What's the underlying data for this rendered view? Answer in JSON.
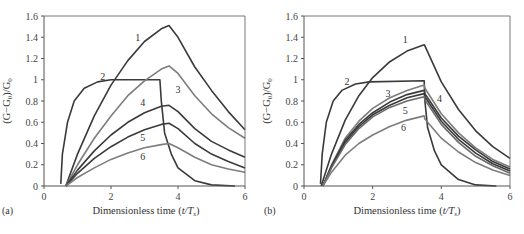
{
  "chart_data": [
    {
      "panel": "(a)",
      "type": "line",
      "title": "",
      "xlabel": "Dimensionless time (t/T_s)",
      "ylabel": "(G−G0)/G0",
      "xlim": [
        0,
        6
      ],
      "ylim": [
        0,
        1.6
      ],
      "xticks": [
        "0",
        "2",
        "4",
        "6"
      ],
      "yticks": [
        "0",
        "0.2",
        "0.4",
        "0.6",
        "0.8",
        "1",
        "1.2",
        "1.4",
        "1.6"
      ],
      "grid": false,
      "series": [
        {
          "name": "1",
          "label_pos": [
            2.8,
            1.39
          ],
          "points": [
            [
              0.65,
              0
            ],
            [
              1.0,
              0.3
            ],
            [
              1.5,
              0.66
            ],
            [
              2.0,
              0.95
            ],
            [
              2.5,
              1.18
            ],
            [
              3.0,
              1.36
            ],
            [
              3.5,
              1.48
            ],
            [
              3.73,
              1.51
            ],
            [
              4.0,
              1.4
            ],
            [
              4.5,
              1.12
            ],
            [
              5.0,
              0.9
            ],
            [
              5.5,
              0.7
            ],
            [
              6.0,
              0.53
            ]
          ]
        },
        {
          "name": "2",
          "label_pos": [
            1.75,
            1.03
          ],
          "points": [
            [
              0.5,
              0.02
            ],
            [
              0.55,
              0.3
            ],
            [
              0.7,
              0.6
            ],
            [
              0.9,
              0.8
            ],
            [
              1.2,
              0.92
            ],
            [
              1.6,
              0.98
            ],
            [
              2.0,
              1.0
            ],
            [
              3.46,
              1.0
            ],
            [
              3.5,
              0.8
            ],
            [
              3.6,
              0.5
            ],
            [
              3.8,
              0.3
            ],
            [
              4.0,
              0.17
            ],
            [
              4.5,
              0.05
            ],
            [
              5.0,
              0.01
            ],
            [
              5.7,
              0.0
            ]
          ]
        },
        {
          "name": "3",
          "label_pos": [
            4.0,
            0.9
          ],
          "points": [
            [
              0.65,
              0
            ],
            [
              1.0,
              0.2
            ],
            [
              1.5,
              0.45
            ],
            [
              2.0,
              0.66
            ],
            [
              2.5,
              0.85
            ],
            [
              3.0,
              0.99
            ],
            [
              3.5,
              1.1
            ],
            [
              3.73,
              1.13
            ],
            [
              4.0,
              1.06
            ],
            [
              4.5,
              0.85
            ],
            [
              5.0,
              0.68
            ],
            [
              5.5,
              0.55
            ],
            [
              6.0,
              0.45
            ]
          ]
        },
        {
          "name": "4",
          "label_pos": [
            2.95,
            0.78
          ],
          "points": [
            [
              0.65,
              0
            ],
            [
              1.0,
              0.15
            ],
            [
              1.5,
              0.33
            ],
            [
              2.0,
              0.48
            ],
            [
              2.5,
              0.6
            ],
            [
              3.0,
              0.69
            ],
            [
              3.5,
              0.75
            ],
            [
              3.73,
              0.76
            ],
            [
              4.0,
              0.7
            ],
            [
              4.5,
              0.54
            ],
            [
              5.0,
              0.42
            ],
            [
              5.5,
              0.34
            ],
            [
              6.0,
              0.27
            ]
          ]
        },
        {
          "name": "5",
          "label_pos": [
            2.95,
            0.45
          ],
          "points": [
            [
              0.65,
              0
            ],
            [
              1.0,
              0.12
            ],
            [
              1.5,
              0.26
            ],
            [
              2.0,
              0.37
            ],
            [
              2.5,
              0.46
            ],
            [
              3.0,
              0.53
            ],
            [
              3.5,
              0.58
            ],
            [
              3.73,
              0.59
            ],
            [
              4.0,
              0.54
            ],
            [
              4.5,
              0.4
            ],
            [
              5.0,
              0.3
            ],
            [
              5.5,
              0.23
            ],
            [
              6.0,
              0.17
            ]
          ]
        },
        {
          "name": "6",
          "label_pos": [
            2.95,
            0.27
          ],
          "points": [
            [
              0.65,
              0
            ],
            [
              1.0,
              0.08
            ],
            [
              1.5,
              0.17
            ],
            [
              2.0,
              0.25
            ],
            [
              2.5,
              0.31
            ],
            [
              3.0,
              0.36
            ],
            [
              3.5,
              0.39
            ],
            [
              3.73,
              0.4
            ],
            [
              4.0,
              0.36
            ],
            [
              4.5,
              0.27
            ],
            [
              5.0,
              0.2
            ],
            [
              5.5,
              0.16
            ],
            [
              6.0,
              0.13
            ]
          ]
        }
      ]
    },
    {
      "panel": "(b)",
      "type": "line",
      "title": "",
      "xlabel": "Dimensionless time (t/T_s)",
      "ylabel": "(G−G0)/G0",
      "xlim": [
        0,
        6
      ],
      "ylim": [
        0,
        1.6
      ],
      "xticks": [
        "0",
        "2",
        "4",
        "6"
      ],
      "yticks": [
        "0",
        "0.2",
        "0.4",
        "0.6",
        "0.8",
        "1",
        "1.2",
        "1.4",
        "1.6"
      ],
      "grid": false,
      "series": [
        {
          "name": "1",
          "label_pos": [
            2.95,
            1.37
          ],
          "points": [
            [
              0.5,
              0
            ],
            [
              0.8,
              0.3
            ],
            [
              1.2,
              0.62
            ],
            [
              1.6,
              0.85
            ],
            [
              2.0,
              1.02
            ],
            [
              2.5,
              1.17
            ],
            [
              3.0,
              1.27
            ],
            [
              3.5,
              1.33
            ],
            [
              3.52,
              1.32
            ],
            [
              4.0,
              0.98
            ],
            [
              4.5,
              0.72
            ],
            [
              5.0,
              0.52
            ],
            [
              5.5,
              0.37
            ],
            [
              6.0,
              0.26
            ]
          ]
        },
        {
          "name": "2",
          "label_pos": [
            1.25,
            0.98
          ],
          "points": [
            [
              0.48,
              0.02
            ],
            [
              0.53,
              0.3
            ],
            [
              0.65,
              0.6
            ],
            [
              0.85,
              0.8
            ],
            [
              1.1,
              0.9
            ],
            [
              1.5,
              0.96
            ],
            [
              1.9,
              0.98
            ],
            [
              3.5,
              0.99
            ],
            [
              3.52,
              0.8
            ],
            [
              3.6,
              0.55
            ],
            [
              3.8,
              0.33
            ],
            [
              4.0,
              0.2
            ],
            [
              4.5,
              0.06
            ],
            [
              5.0,
              0.01
            ],
            [
              5.6,
              0.0
            ]
          ]
        },
        {
          "name": "3",
          "label_pos": [
            2.45,
            0.87
          ],
          "points": [
            [
              0.55,
              0
            ],
            [
              0.8,
              0.2
            ],
            [
              1.2,
              0.45
            ],
            [
              1.6,
              0.61
            ],
            [
              2.0,
              0.73
            ],
            [
              2.5,
              0.83
            ],
            [
              3.0,
              0.9
            ],
            [
              3.5,
              0.95
            ],
            [
              3.52,
              0.92
            ],
            [
              4.0,
              0.68
            ],
            [
              4.5,
              0.5
            ],
            [
              5.0,
              0.36
            ],
            [
              5.5,
              0.25
            ],
            [
              6.0,
              0.18
            ]
          ]
        },
        {
          "name": "4",
          "label_pos": [
            3.95,
            0.82
          ],
          "points": [
            [
              0.55,
              0
            ],
            [
              0.8,
              0.19
            ],
            [
              1.2,
              0.43
            ],
            [
              1.6,
              0.58
            ],
            [
              2.0,
              0.69
            ],
            [
              2.5,
              0.79
            ],
            [
              3.0,
              0.86
            ],
            [
              3.5,
              0.9
            ],
            [
              3.52,
              0.87
            ],
            [
              4.0,
              0.64
            ],
            [
              4.5,
              0.47
            ],
            [
              5.0,
              0.34
            ],
            [
              5.5,
              0.23
            ],
            [
              6.0,
              0.16
            ]
          ]
        },
        {
          "name": "5",
          "label_pos": [
            2.95,
            0.71
          ],
          "points": [
            [
              0.55,
              0
            ],
            [
              0.8,
              0.18
            ],
            [
              1.2,
              0.41
            ],
            [
              1.6,
              0.56
            ],
            [
              2.0,
              0.67
            ],
            [
              2.5,
              0.76
            ],
            [
              3.0,
              0.83
            ],
            [
              3.5,
              0.87
            ],
            [
              3.52,
              0.84
            ],
            [
              4.0,
              0.61
            ],
            [
              4.5,
              0.44
            ],
            [
              5.0,
              0.31
            ],
            [
              5.5,
              0.21
            ],
            [
              6.0,
              0.14
            ]
          ]
        },
        {
          "name": "5b",
          "label_pos": null,
          "points": [
            [
              0.55,
              0
            ],
            [
              0.8,
              0.17
            ],
            [
              1.2,
              0.39
            ],
            [
              1.6,
              0.54
            ],
            [
              2.0,
              0.65
            ],
            [
              2.5,
              0.74
            ],
            [
              3.0,
              0.8
            ],
            [
              3.5,
              0.84
            ],
            [
              3.52,
              0.81
            ],
            [
              4.0,
              0.58
            ],
            [
              4.5,
              0.41
            ],
            [
              5.0,
              0.28
            ],
            [
              5.5,
              0.19
            ],
            [
              6.0,
              0.12
            ]
          ]
        },
        {
          "name": "6",
          "label_pos": [
            2.9,
            0.55
          ],
          "points": [
            [
              0.55,
              0
            ],
            [
              0.8,
              0.13
            ],
            [
              1.2,
              0.29
            ],
            [
              1.6,
              0.4
            ],
            [
              2.0,
              0.48
            ],
            [
              2.5,
              0.56
            ],
            [
              3.0,
              0.62
            ],
            [
              3.5,
              0.66
            ],
            [
              3.52,
              0.63
            ],
            [
              4.0,
              0.45
            ],
            [
              4.5,
              0.32
            ],
            [
              5.0,
              0.22
            ],
            [
              5.5,
              0.15
            ],
            [
              6.0,
              0.1
            ]
          ]
        }
      ]
    }
  ],
  "panels": [
    {
      "label": "(a)",
      "xlabel": "Dimensionless time (",
      "xlabel_var": "t/T",
      "xlabel_sub": "s",
      "xlabel_end": ")",
      "ylabel": "(G−G",
      "ylabel_sub": "0",
      "ylabel_mid": ")/G",
      "ylabel_sub2": "0"
    },
    {
      "label": "(b)",
      "xlabel": "Dimensionless time (",
      "xlabel_var": "t/T",
      "xlabel_sub": "s",
      "xlabel_end": ")",
      "ylabel": "(G−G",
      "ylabel_sub": "0",
      "ylabel_mid": ")/G",
      "ylabel_sub2": "0"
    }
  ],
  "colors": {
    "axis": "#555555",
    "dark": "#3a3a3a",
    "mid": "#6a6a6a",
    "light": "#7d7d7d"
  }
}
